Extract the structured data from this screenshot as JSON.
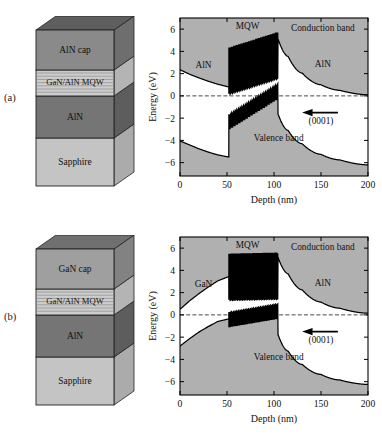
{
  "figure": {
    "panels": [
      {
        "id": "a",
        "label": "(a)",
        "stack": {
          "layers": [
            {
              "name": "cap",
              "label": "AlN cap",
              "color": "#8a8a8a",
              "top_color": "#5e5e5e",
              "side_color": "#6e6e6e"
            },
            {
              "name": "mqw",
              "label": "GaN/AlN MQW",
              "color": "#cdcdcd",
              "top_color": "#a0a0a0",
              "side_color": "#b4b4b4"
            },
            {
              "name": "barrier",
              "label": "AlN",
              "color": "#757575",
              "top_color": "#4e4e4e",
              "side_color": "#5d5d5d"
            },
            {
              "name": "substrate",
              "label": "Sapphire",
              "color": "#c4c4c4",
              "top_color": "#9a9a9a",
              "side_color": "#ababab"
            }
          ]
        },
        "chart": {
          "annotations": {
            "left_material": "AlN",
            "mqw": "MQW",
            "conduction": "Conduction band",
            "right_material": "AlN",
            "valence": "Valence band",
            "direction": "(0001)"
          }
        },
        "chart_data": {
          "type": "line",
          "title": "",
          "xlabel": "Depth (nm)",
          "ylabel": "Energy (eV)",
          "xlim": [
            0,
            200
          ],
          "ylim": [
            -7.2,
            7.0
          ],
          "xticks": [
            0,
            50,
            100,
            150,
            200
          ],
          "yticks": [
            -6,
            -4,
            -2,
            0,
            2,
            4,
            6
          ],
          "grid": false,
          "legend_position": "none",
          "fermi_level": 0,
          "mqw_region": [
            52,
            104
          ],
          "mqw_periods": 20,
          "series": [
            {
              "name": "Conduction band",
              "x": [
                0,
                10,
                20,
                30,
                40,
                52,
                52,
                104,
                104,
                115,
                130,
                150,
                170,
                200
              ],
              "y": [
                2.35,
                1.95,
                1.62,
                1.32,
                1.05,
                0.8,
                5.35,
                5.75,
                5.2,
                3.55,
                2.05,
                1.0,
                0.5,
                0.1
              ],
              "mqw_oscillation": {
                "start": 52,
                "end": 104,
                "amplitude_low": 1.0,
                "baseline_start": 4.3,
                "baseline_end": 5.7
              }
            },
            {
              "name": "Valence band",
              "x": [
                0,
                10,
                20,
                30,
                40,
                52,
                52,
                104,
                104,
                115,
                130,
                150,
                170,
                200
              ],
              "y": [
                -4.05,
                -4.4,
                -4.75,
                -5.05,
                -5.3,
                -5.5,
                -2.95,
                -0.2,
                -1.55,
                -3.1,
                -4.3,
                -5.25,
                -5.75,
                -6.2
              ],
              "mqw_oscillation": {
                "start": 52,
                "end": 104,
                "amplitude_low": 1.0,
                "baseline_start": -2.95,
                "baseline_end": -0.2
              }
            }
          ]
        }
      },
      {
        "id": "b",
        "label": "(b)",
        "stack": {
          "layers": [
            {
              "name": "cap",
              "label": "GaN cap",
              "color": "#9f9f9f",
              "top_color": "#707070",
              "side_color": "#828282"
            },
            {
              "name": "mqw",
              "label": "GaN/AlN MQW",
              "color": "#cdcdcd",
              "top_color": "#a0a0a0",
              "side_color": "#b4b4b4"
            },
            {
              "name": "barrier",
              "label": "AlN",
              "color": "#757575",
              "top_color": "#4e4e4e",
              "side_color": "#5d5d5d"
            },
            {
              "name": "substrate",
              "label": "Sapphire",
              "color": "#c4c4c4",
              "top_color": "#9a9a9a",
              "side_color": "#ababab"
            }
          ]
        },
        "chart": {
          "annotations": {
            "left_material": "GaN",
            "mqw": "MQW",
            "conduction": "Conduction band",
            "right_material": "AlN",
            "valence": "Valence band",
            "direction": "(0001)"
          }
        },
        "chart_data": {
          "type": "line",
          "title": "",
          "xlabel": "Depth (nm)",
          "ylabel": "Energy (eV)",
          "xlim": [
            0,
            200
          ],
          "ylim": [
            -7.2,
            7.0
          ],
          "xticks": [
            0,
            50,
            100,
            150,
            200
          ],
          "yticks": [
            -6,
            -4,
            -2,
            0,
            2,
            4,
            6
          ],
          "grid": false,
          "legend_position": "none",
          "fermi_level": 0,
          "mqw_region": [
            52,
            104
          ],
          "mqw_periods": 20,
          "series": [
            {
              "name": "Conduction band",
              "x": [
                0,
                10,
                20,
                30,
                40,
                52,
                52,
                104,
                104,
                115,
                130,
                150,
                170,
                200
              ],
              "y": [
                0.5,
                1.25,
                1.9,
                2.5,
                3.05,
                3.45,
                5.45,
                5.55,
                5.25,
                3.7,
                2.25,
                1.15,
                0.6,
                0.15
              ],
              "mqw_oscillation": {
                "start": 52,
                "end": 104,
                "amplitude_low": 1.0,
                "baseline_start": 5.45,
                "baseline_end": 5.55
              }
            },
            {
              "name": "Valence band",
              "x": [
                0,
                10,
                20,
                30,
                40,
                52,
                52,
                104,
                104,
                115,
                130,
                150,
                170,
                200
              ],
              "y": [
                -2.8,
                -2.15,
                -1.55,
                -1.05,
                -0.6,
                -0.35,
                -1.05,
                -0.3,
                -1.7,
                -3.25,
                -4.45,
                -5.35,
                -5.85,
                -6.25
              ],
              "mqw_oscillation": {
                "start": 52,
                "end": 104,
                "amplitude_low": 1.0,
                "baseline_start": -1.05,
                "baseline_end": -0.3
              }
            }
          ]
        }
      }
    ]
  }
}
